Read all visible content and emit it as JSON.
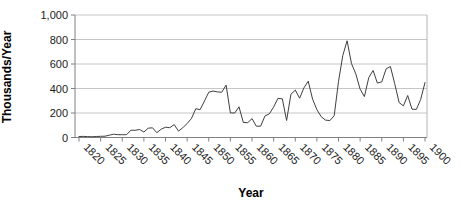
{
  "chart_data": {
    "type": "line",
    "title": "",
    "xlabel": "Year",
    "ylabel": "Thousands/Year",
    "ylim": [
      0,
      1000
    ],
    "xlim": [
      1820,
      1900
    ],
    "grid": "horizontal",
    "legend": "none",
    "y_ticks": [
      0,
      200,
      400,
      600,
      800,
      1000
    ],
    "y_tick_labels": [
      "0",
      "200",
      "400",
      "600",
      "800",
      "1,000"
    ],
    "x_ticks": [
      1820,
      1825,
      1830,
      1835,
      1840,
      1845,
      1850,
      1855,
      1860,
      1865,
      1870,
      1875,
      1880,
      1885,
      1890,
      1895,
      1900
    ],
    "x_tick_labels": [
      "1820",
      "1825",
      "1830",
      "1835",
      "1840",
      "1845",
      "1850",
      "1855",
      "1860",
      "1865",
      "1870",
      "1875",
      "1880",
      "1885",
      "1890",
      "1895",
      "1900"
    ],
    "years": [
      1820,
      1821,
      1822,
      1823,
      1824,
      1825,
      1826,
      1827,
      1828,
      1829,
      1830,
      1831,
      1832,
      1833,
      1834,
      1835,
      1836,
      1837,
      1838,
      1839,
      1840,
      1841,
      1842,
      1843,
      1844,
      1845,
      1846,
      1847,
      1848,
      1849,
      1850,
      1851,
      1852,
      1853,
      1854,
      1855,
      1856,
      1857,
      1858,
      1859,
      1860,
      1861,
      1862,
      1863,
      1864,
      1865,
      1866,
      1867,
      1868,
      1869,
      1870,
      1871,
      1872,
      1873,
      1874,
      1875,
      1876,
      1877,
      1878,
      1879,
      1880,
      1881,
      1882,
      1883,
      1884,
      1885,
      1886,
      1887,
      1888,
      1889,
      1890,
      1891,
      1892,
      1893,
      1894,
      1895,
      1896,
      1897,
      1898,
      1899,
      1900
    ],
    "values": [
      8,
      9,
      7,
      6,
      8,
      10,
      11,
      19,
      27,
      23,
      23,
      23,
      60,
      59,
      65,
      45,
      76,
      79,
      39,
      68,
      84,
      80,
      105,
      52,
      79,
      114,
      154,
      235,
      227,
      297,
      370,
      380,
      372,
      369,
      428,
      201,
      200,
      251,
      123,
      121,
      154,
      92,
      92,
      176,
      193,
      248,
      319,
      316,
      139,
      353,
      387,
      321,
      405,
      460,
      313,
      227,
      170,
      142,
      138,
      178,
      457,
      669,
      789,
      603,
      519,
      395,
      334,
      490,
      547,
      444,
      455,
      560,
      580,
      440,
      286,
      258,
      343,
      231,
      229,
      312,
      449
    ],
    "colors": {
      "line": "#3f3f3f",
      "gridline": "#c6c6c6",
      "axis": "#808080",
      "plot_border": "#b4b4b4",
      "text": "#000000",
      "background": "#ffffff"
    }
  }
}
